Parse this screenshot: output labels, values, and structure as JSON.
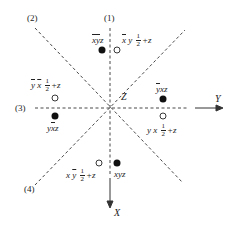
{
  "diagram": {
    "type": "symmetry-operation-projection",
    "axes": {
      "x_label": "X",
      "y_label": "Y",
      "z_label": "Z"
    },
    "mirror_lines": [
      {
        "id": "1",
        "label": "(1)",
        "orientation": "vertical"
      },
      {
        "id": "2",
        "label": "(2)",
        "orientation": "diagonal-down"
      },
      {
        "id": "3",
        "label": "(3)",
        "orientation": "horizontal"
      },
      {
        "id": "4",
        "label": "(4)",
        "orientation": "diagonal-up"
      }
    ],
    "positions": [
      {
        "id": "p1",
        "marker": "filled",
        "coords": "x̄ȳz",
        "parts": [
          "x",
          "y",
          "z"
        ],
        "bars": [
          true,
          true,
          false
        ],
        "half": false
      },
      {
        "id": "p2",
        "marker": "open",
        "parts": [
          "x",
          "y"
        ],
        "bars": [
          true,
          false
        ],
        "half": true,
        "suffix": "+z",
        "frac_n": "1",
        "frac_d": "2"
      },
      {
        "id": "p3",
        "marker": "open",
        "parts": [
          "y",
          "x"
        ],
        "bars": [
          true,
          true
        ],
        "half": true,
        "suffix": "+z",
        "frac_n": "1",
        "frac_d": "2"
      },
      {
        "id": "p4",
        "marker": "filled",
        "coords": "yx̄z",
        "parts": [
          "y",
          "x",
          "z"
        ],
        "bars": [
          false,
          true,
          false
        ],
        "half": false
      },
      {
        "id": "p5",
        "marker": "filled",
        "coords": "ȳxz",
        "parts": [
          "y",
          "x",
          "z"
        ],
        "bars": [
          true,
          false,
          false
        ],
        "half": false
      },
      {
        "id": "p6",
        "marker": "open",
        "parts": [
          "y",
          "x"
        ],
        "bars": [
          false,
          false
        ],
        "half": true,
        "suffix": "+z",
        "frac_n": "1",
        "frac_d": "2"
      },
      {
        "id": "p7",
        "marker": "open",
        "parts": [
          "x",
          "y"
        ],
        "bars": [
          false,
          true
        ],
        "half": true,
        "suffix": "+z",
        "frac_n": "1",
        "frac_d": "2"
      },
      {
        "id": "p8",
        "marker": "filled",
        "coords": "xyz",
        "parts": [
          "x",
          "y",
          "z"
        ],
        "bars": [
          false,
          false,
          false
        ],
        "half": false
      }
    ]
  }
}
